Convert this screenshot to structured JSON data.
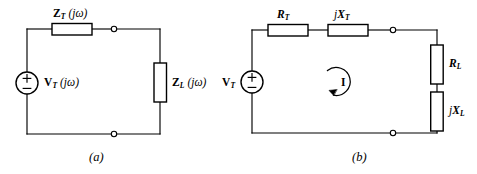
{
  "figure": {
    "background_color": "#ffffff",
    "line_color": "#000000"
  },
  "circuit_a": {
    "caption": "(a)",
    "source": {
      "name": "thevenin-voltage-source",
      "label_v": "V",
      "label_sub": "T",
      "label_arg": "(jω)",
      "plus": "+",
      "minus": "−"
    },
    "series_element": {
      "name": "thevenin-impedance",
      "label_z": "Z",
      "label_sub": "T",
      "label_arg": "(jω)"
    },
    "load_element": {
      "name": "load-impedance",
      "label_z": "Z",
      "label_sub": "L",
      "label_arg": "(jω)"
    },
    "terminals": [
      "top-terminal-node",
      "bottom-terminal-node"
    ]
  },
  "circuit_b": {
    "caption": "(b)",
    "source": {
      "name": "thevenin-voltage-source",
      "label_v": "V",
      "label_sub": "T",
      "plus": "+",
      "minus": "−"
    },
    "series_resistor": {
      "name": "thevenin-resistance",
      "label_r": "R",
      "label_sub": "T"
    },
    "series_reactance": {
      "name": "thevenin-reactance",
      "label_j": "j",
      "label_x": "X",
      "label_sub": "T"
    },
    "load_resistor": {
      "name": "load-resistance",
      "label_r": "R",
      "label_sub": "L"
    },
    "load_reactance": {
      "name": "load-reactance",
      "label_j": "j",
      "label_x": "X",
      "label_sub": "L"
    },
    "mesh_current": {
      "name": "mesh-current",
      "label": "I",
      "direction": "clockwise"
    },
    "terminals": [
      "top-terminal-node",
      "bottom-terminal-node"
    ]
  }
}
